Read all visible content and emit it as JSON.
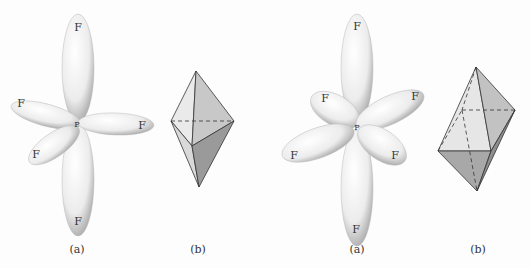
{
  "figures": [
    {
      "id": "left",
      "panel_a": {
        "caption": "(a)",
        "center_atom": "P",
        "ligands": [
          "F",
          "F",
          "F",
          "F",
          "F"
        ]
      },
      "panel_b": {
        "caption": "(b)",
        "shape": "trigonal bipyramid"
      }
    },
    {
      "id": "right",
      "panel_a": {
        "caption": "(a)",
        "center_atom": "P",
        "ligands": [
          "F",
          "F",
          "F",
          "F",
          "F",
          "F"
        ]
      },
      "panel_b": {
        "caption": "(b)",
        "shape": "octahedron"
      }
    }
  ]
}
